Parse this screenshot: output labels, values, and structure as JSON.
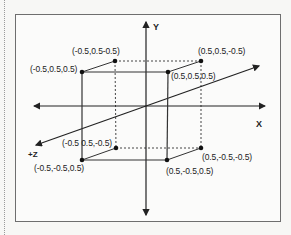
{
  "diagram": {
    "axes": {
      "x_label": "X",
      "y_label": "Y",
      "z_label": "+Z"
    },
    "vertices": [
      {
        "id": "back-top-left",
        "label": "(-0.5,0.5-0.5)"
      },
      {
        "id": "front-top-left",
        "label": "(-0.5,0.5,0.5)"
      },
      {
        "id": "back-top-right",
        "label": "(0.5,0.5,-0.5)"
      },
      {
        "id": "front-top-right",
        "label": "(0.5,0.5,0.5)"
      },
      {
        "id": "back-bottom-left",
        "label": "(-0.5 0.5,-0.5)"
      },
      {
        "id": "front-bottom-left",
        "label": "(-0.5,-0.5,0.5)"
      },
      {
        "id": "back-bottom-right",
        "label": "(0.5,-0.5,-0.5)"
      },
      {
        "id": "front-bottom-right",
        "label": "(0.5,-0.5,0.5)"
      }
    ],
    "colors": {
      "line": "#333333",
      "frame": "#6e6e6e",
      "background": "#fbfbfa"
    }
  }
}
